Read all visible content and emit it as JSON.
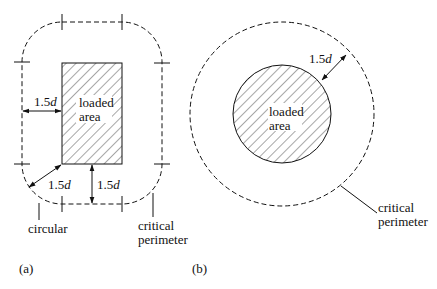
{
  "figure_a": {
    "panel_label": "(a)",
    "loaded_area_label_line1": "loaded",
    "loaded_area_label_line2": "area",
    "dim_left": "1.5",
    "dim_corner": "1.5",
    "dim_bottom": "1.5",
    "dim_unit": "d",
    "callout_left": "circular",
    "callout_right_line1": "critical",
    "callout_right_line2": "perimeter"
  },
  "figure_b": {
    "panel_label": "(b)",
    "loaded_area_label_line1": "loaded",
    "loaded_area_label_line2": "area",
    "dim": "1.5",
    "dim_unit": "d",
    "callout_line1": "critical",
    "callout_line2": "perimeter"
  },
  "colors": {
    "line": "#111111",
    "background": "#ffffff"
  }
}
